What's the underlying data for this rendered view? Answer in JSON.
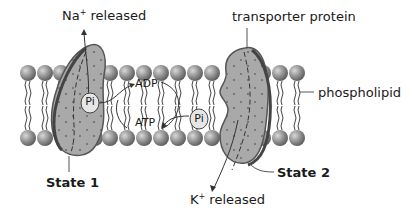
{
  "labels": {
    "sodium_prefix": "Na",
    "sodium_charge": "+",
    "sodium_suffix": " released",
    "transporter": "transporter protein",
    "phospholipid": "phospholipid",
    "state1": "State 1",
    "state2": "State 2",
    "potassium_prefix": "K",
    "potassium_charge": "+",
    "potassium_suffix": " released",
    "adp": "ADP",
    "atp": "ATP",
    "pi_left": "Pi",
    "pi_right": "Pi"
  },
  "colors": {
    "protein_fill": "#a9a9a9",
    "protein_edge": "#555555",
    "head_fill": "#8c8c8c",
    "tail": "#444444",
    "line": "#333333",
    "pi_fill": "#e6e6e6"
  }
}
